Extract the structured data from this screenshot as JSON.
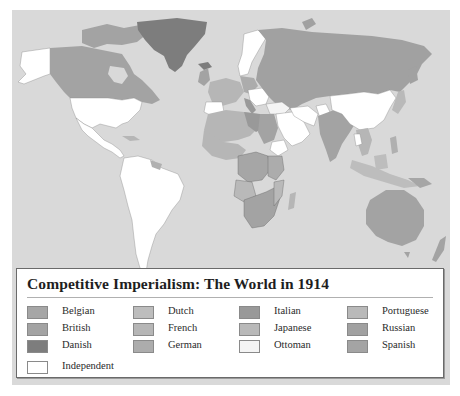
{
  "map": {
    "title": "Competitive Imperialism: The World in 1914",
    "ocean_color": "#d9d9d9",
    "legend": {
      "columns": [
        [
          {
            "label": "Belgian",
            "color": "#a6a6a6"
          },
          {
            "label": "British",
            "color": "#a3a3a3"
          },
          {
            "label": "Danish",
            "color": "#7d7d7d"
          }
        ],
        [
          {
            "label": "Dutch",
            "color": "#bdbdbd"
          },
          {
            "label": "French",
            "color": "#b6b6b6"
          },
          {
            "label": "German",
            "color": "#acacac"
          }
        ],
        [
          {
            "label": "Italian",
            "color": "#999999"
          },
          {
            "label": "Japanese",
            "color": "#b9b9b9"
          },
          {
            "label": "Ottoman",
            "color": "#f4f4f4"
          }
        ],
        [
          {
            "label": "Portuguese",
            "color": "#b9b9b9"
          },
          {
            "label": "Russian",
            "color": "#a1a1a1"
          },
          {
            "label": "Spanish",
            "color": "#a4a4a4"
          }
        ]
      ],
      "extra": {
        "label": "Independent",
        "color": "#ffffff"
      }
    },
    "regions": {
      "greenland": "Danish",
      "canada": "British",
      "alaska_usa": "Independent",
      "latin_america": "Independent",
      "russia": "Russian",
      "china_persia_afghanistan_ethiopia": "Independent",
      "africa": "European colonies",
      "india_australia_newzealand": "British",
      "arabia_anatolia": "Ottoman"
    }
  }
}
